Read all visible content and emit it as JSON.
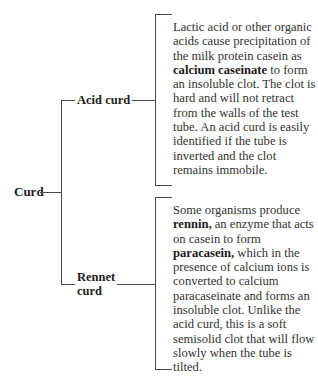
{
  "diagram": {
    "root": {
      "label": "Curd"
    },
    "branches": [
      {
        "label": "Acid curd",
        "description_parts": [
          {
            "text": "Lactic acid or other organic acids cause precipitation of the milk protein casein as ",
            "bold": false
          },
          {
            "text": "calcium caseinate",
            "bold": true
          },
          {
            "text": " to form an insoluble clot. The clot is hard and will not retract from the walls of the test tube. An acid curd is easily identified if the tube is inverted and the clot remains immobile.",
            "bold": false
          }
        ]
      },
      {
        "label_line1": "Rennet",
        "label_line2": "curd",
        "description_parts": [
          {
            "text": "Some organisms produce ",
            "bold": false
          },
          {
            "text": "rennin,",
            "bold": true
          },
          {
            "text": " an enzyme that acts on casein to form ",
            "bold": false
          },
          {
            "text": "paracasein,",
            "bold": true
          },
          {
            "text": " which in the presence of calcium ions is converted to calcium paracaseinate and forms an insoluble clot. Unlike the acid curd, this is a soft semisolid clot that will flow slowly when the tube is tilted.",
            "bold": false
          }
        ]
      }
    ]
  },
  "colors": {
    "line": "#4a4a4a",
    "text": "#333333",
    "background": "#ffffff"
  }
}
